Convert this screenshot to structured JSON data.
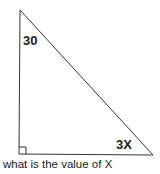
{
  "diagram": {
    "type": "right-triangle",
    "line_color": "#333333",
    "vertices": {
      "top": [
        20,
        10
      ],
      "bottom_left": [
        19,
        154
      ],
      "bottom_right": [
        153,
        155
      ]
    },
    "right_angle_at": "bottom_left",
    "labels": {
      "top_angle": "30",
      "bottom_right_angle": "3X"
    }
  },
  "caption": "what is the value of X"
}
